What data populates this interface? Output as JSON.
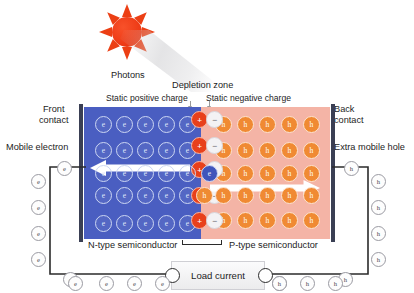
{
  "diagram": {
    "icons": {
      "sun": "sun-icon",
      "beam": "photon-beam-icon"
    },
    "colors": {
      "n_type_blue": "#4a5ec1",
      "p_type_pink": "#f4b4a6",
      "hole_orange": "#f08a33",
      "positive_red": "#e8401b",
      "negative_grey": "#f3f2f4",
      "contact_bar": "#3a3f54",
      "sun_red": "#ec3f14",
      "wire_black": "#2b2b2b"
    }
  },
  "labels": {
    "photons": "Photons",
    "depletion_zone": "Depletion zone",
    "static_positive": "Static positive charge",
    "static_negative": "Static negative charge",
    "front_contact_line1": "Front",
    "front_contact_line2": "contact",
    "back_contact_line1": "Back",
    "back_contact_line2": "contact",
    "mobile_electron": "Mobile electron",
    "extra_mobile_hole": "Extra mobile hole",
    "n_type": "N-type semiconductor",
    "p_type": "P-type semiconductor",
    "load_current": "Load current"
  },
  "carriers": {
    "electron_symbol": "e",
    "hole_symbol": "h",
    "positive_symbol": "+",
    "negative_symbol": "−"
  },
  "lattice": {
    "n_rows": 5,
    "n_cols": 5,
    "p_rows": 5,
    "p_cols": 5,
    "depletion_pairs": 5
  },
  "circuit": {
    "left_wire_carrier": "e",
    "right_wire_carrier": "h",
    "left_wire_count": 4,
    "right_wire_count": 4,
    "bottom_left_count": 4,
    "bottom_right_count": 4,
    "top_left_count": 1,
    "top_right_count": 1
  },
  "flow": {
    "electron_direction": "left",
    "hole_direction": "right"
  }
}
